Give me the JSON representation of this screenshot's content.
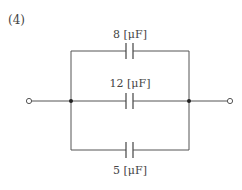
{
  "problem": {
    "number_label": "(4)"
  },
  "circuit": {
    "type": "parallel capacitors",
    "capacitors": [
      {
        "position": "top",
        "value": "8",
        "unit": "[μF]",
        "label": "8 [μF]"
      },
      {
        "position": "middle",
        "value": "12",
        "unit": "[μF]",
        "label": "12 [μF]"
      },
      {
        "position": "bottom",
        "value": "5",
        "unit": "[μF]",
        "label": "5 [μF]"
      }
    ],
    "terminals": [
      "left-terminal",
      "right-terminal"
    ],
    "junctions": [
      "left-node",
      "right-node"
    ]
  }
}
